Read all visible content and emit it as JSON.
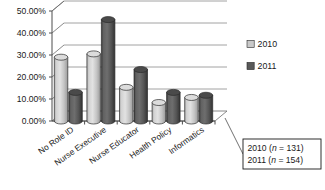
{
  "chart_data": {
    "type": "bar",
    "title": "",
    "subtitle": "",
    "xlabel": "",
    "ylabel": "",
    "categories": [
      "No Role ID",
      "Nurse Executive",
      "Nurse Educator",
      "Health Policy",
      "Informatics"
    ],
    "series": [
      {
        "name": "2010",
        "color": "#c9c9c9",
        "values": [
          29.0,
          30.5,
          15.3,
          8.4,
          10.7
        ]
      },
      {
        "name": "2011",
        "color": "#595959",
        "values": [
          13.0,
          46.1,
          23.4,
          13.0,
          11.7
        ]
      }
    ],
    "ylim": [
      0,
      50
    ],
    "ytick_values": [
      0,
      10,
      20,
      30,
      40,
      50
    ],
    "ytick_labels": [
      "0.00%",
      "10.00%",
      "20.00%",
      "30.00%",
      "40.00%",
      "50.00%"
    ],
    "grid": true,
    "grid_axis": "y",
    "legend_position": "right",
    "style": "3d-cylinder",
    "annotations": [
      {
        "name": "sample-size-note",
        "lines": [
          "2010 (n = 131)",
          "2011 (n = 154)"
        ]
      }
    ]
  },
  "legend": {
    "entries": [
      {
        "label": "2010",
        "color": "#c9c9c9"
      },
      {
        "label": "2011",
        "color": "#595959"
      }
    ]
  },
  "note_box": {
    "line1_year": "2010",
    "line1_n_prefix": "(",
    "line1_n_italic": "n",
    "line1_n_suffix": " = 131)",
    "line2_year": "2011",
    "line2_n_prefix": "(",
    "line2_n_italic": "n",
    "line2_n_suffix": " = 154)"
  },
  "colors": {
    "series_2010": "#c9c9c9",
    "series_2011": "#595959",
    "axis": "#4d4d4d",
    "grid": "#808080",
    "text": "#1a1a1a",
    "background": "#ffffff"
  }
}
